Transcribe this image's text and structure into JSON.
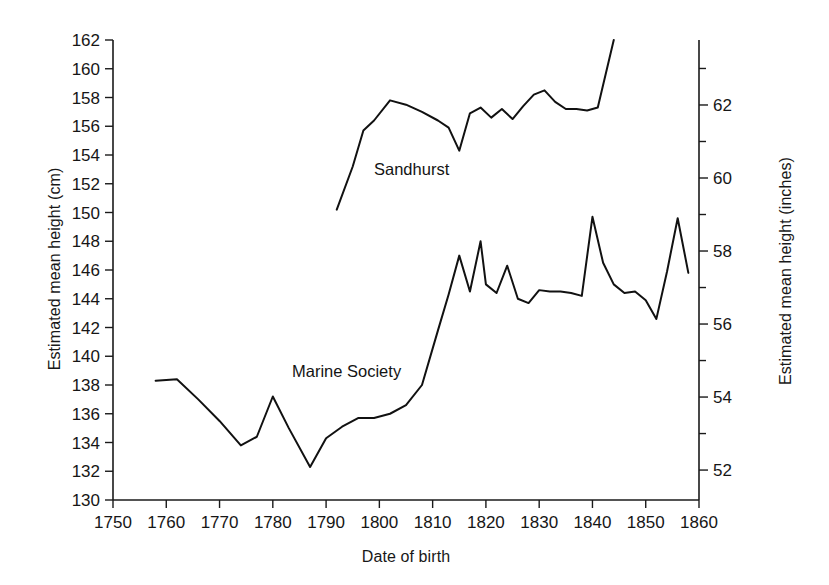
{
  "chart_data": {
    "type": "line",
    "title": "",
    "xlabel": "Date of birth",
    "ylabel": "Estimated mean height (cm)",
    "ylabel_right": "Estimated mean height (inches)",
    "xlim": [
      1750,
      1860
    ],
    "ylim": [
      130,
      162
    ],
    "ylim_right": [
      51.18,
      63.78
    ],
    "xticks": [
      "1750",
      "1760",
      "1770",
      "1780",
      "1790",
      "1800",
      "1810",
      "1820",
      "1830",
      "1840",
      "1850",
      "1860"
    ],
    "yticks": [
      "130",
      "132",
      "134",
      "136",
      "138",
      "140",
      "142",
      "144",
      "146",
      "148",
      "150",
      "152",
      "154",
      "156",
      "158",
      "160",
      "162"
    ],
    "yticks_right": [
      "52",
      "54",
      "56",
      "58",
      "60",
      "62"
    ],
    "grid": false,
    "legend_position": "inline-annotation",
    "series": [
      {
        "name": "Sandhurst",
        "x": [
          1792,
          1795,
          1797,
          1799,
          1802,
          1805,
          1808,
          1811,
          1813,
          1815,
          1817,
          1819,
          1821,
          1823,
          1825,
          1827,
          1829,
          1831,
          1833,
          1835,
          1837,
          1839,
          1841,
          1844
        ],
        "values": [
          150.2,
          153.2,
          155.7,
          156.4,
          157.8,
          157.5,
          157.0,
          156.4,
          155.9,
          154.3,
          156.9,
          157.3,
          156.6,
          157.2,
          156.5,
          157.4,
          158.2,
          158.5,
          157.7,
          157.2,
          157.2,
          157.1,
          157.3,
          162.0
        ]
      },
      {
        "name": "Marine Society",
        "x": [
          1758,
          1762,
          1766,
          1770,
          1774,
          1777,
          1780,
          1783,
          1787,
          1790,
          1793,
          1796,
          1799,
          1802,
          1805,
          1808,
          1811,
          1813,
          1815,
          1817,
          1819,
          1820,
          1822,
          1824,
          1826,
          1828,
          1830,
          1832,
          1834,
          1836,
          1838,
          1840,
          1842,
          1844,
          1846,
          1848,
          1850,
          1852,
          1854,
          1856,
          1858
        ],
        "values": [
          138.3,
          138.4,
          137.0,
          135.5,
          133.8,
          134.4,
          137.2,
          135.0,
          132.3,
          134.3,
          135.1,
          135.7,
          135.7,
          136.0,
          136.6,
          138.0,
          141.8,
          144.3,
          147.0,
          144.5,
          148.0,
          145.0,
          144.4,
          146.3,
          144.0,
          143.7,
          144.6,
          144.5,
          144.5,
          144.4,
          144.2,
          149.7,
          146.5,
          145.0,
          144.4,
          144.5,
          143.9,
          142.6,
          145.9,
          149.6,
          145.8
        ]
      }
    ],
    "annotations": [
      {
        "text": "Sandhurst",
        "x": 1792,
        "y": 151.5
      },
      {
        "text": "Marine Society",
        "x": 1778,
        "y": 138.5
      }
    ]
  }
}
